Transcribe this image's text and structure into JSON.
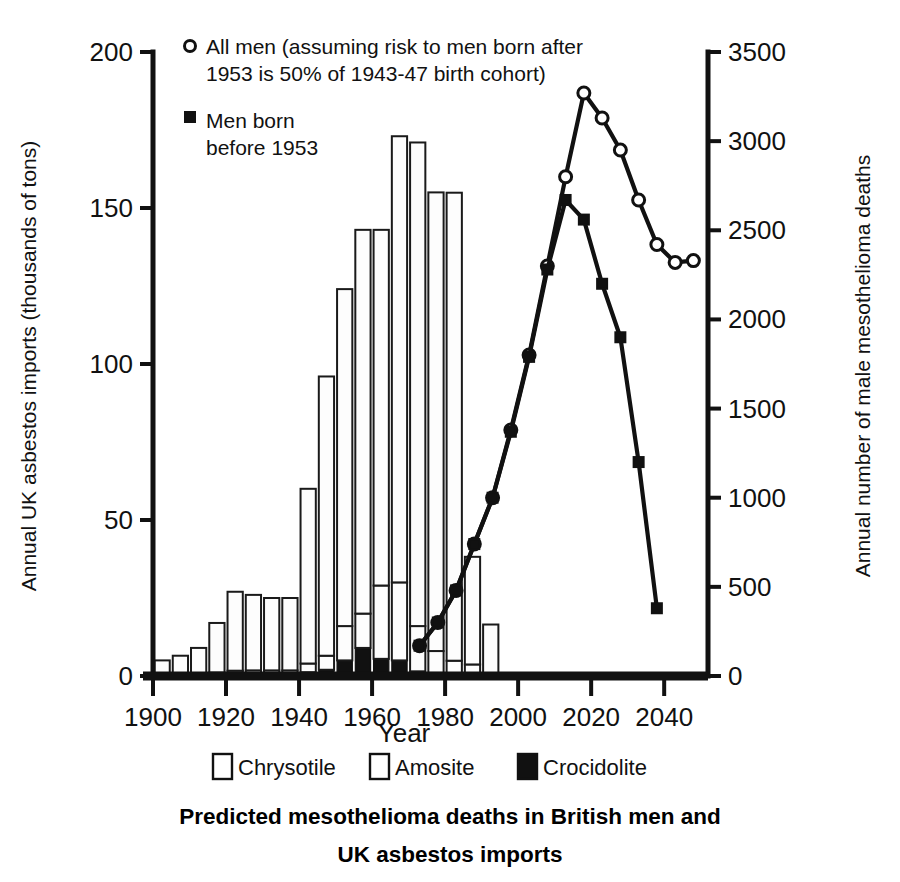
{
  "title": {
    "line1": "Predicted mesothelioma deaths in British men and",
    "line2": "UK asbestos imports"
  },
  "axes": {
    "left_label": "Annual UK asbestos imports (thousands of tons)",
    "right_label": "Annual number of male mesothelioma deaths",
    "x_label": "Year",
    "left_ticks": [
      "0",
      "50",
      "100",
      "150",
      "200"
    ],
    "right_ticks": [
      "0",
      "500",
      "1000",
      "1500",
      "2000",
      "2500",
      "3000",
      "3500"
    ],
    "x_ticks": [
      "1900",
      "1920",
      "1940",
      "1960",
      "1980",
      "2000",
      "2020",
      "2040"
    ]
  },
  "legend": {
    "series1_line1": "All men (assuming risk to men born after",
    "series1_line2": "1953 is 50% of 1943-47 birth cohort)",
    "series2_line1": "Men born",
    "series2_line2": "before 1953",
    "marker1": "open-circle-marker",
    "marker2": "filled-square-marker"
  },
  "key": {
    "items": [
      {
        "label": "Chrysotile",
        "swatch": "white-square-swatch",
        "color": "#ffffff"
      },
      {
        "label": "Amosite",
        "swatch": "white-square-swatch",
        "color": "#ffffff"
      },
      {
        "label": "Crocidolite",
        "swatch": "black-square-swatch",
        "color": "#111111"
      }
    ]
  },
  "colors": {
    "ink": "#111111",
    "fill_light": "#fdfdfd",
    "fill_dark": "#111111"
  },
  "chart_data": {
    "type": "bar",
    "xlabel": "Year",
    "ylabel": "Annual UK asbestos imports (thousands of tons)",
    "y2label": "Annual number of male mesothelioma deaths",
    "xlim": [
      1900,
      2052
    ],
    "ylim": [
      0,
      200
    ],
    "y2lim": [
      0,
      3500
    ],
    "grid": false,
    "legend_position": "top-left and bottom",
    "bars": {
      "note": "Stacked bars, 5-year bins plotted at bin start year; values in thousands of tons",
      "bin_width_years": 5,
      "categories": [
        1900,
        1905,
        1910,
        1915,
        1920,
        1925,
        1930,
        1935,
        1940,
        1945,
        1950,
        1955,
        1960,
        1965,
        1970,
        1975,
        1980,
        1985,
        1990
      ],
      "series": [
        {
          "name": "Crocidolite",
          "values": [
            0.3,
            0.4,
            0.5,
            0.6,
            0.8,
            0.8,
            0.8,
            0.8,
            1.2,
            2.0,
            5.0,
            9.0,
            5.5,
            5.0,
            1.5,
            1.0,
            0.4,
            0.2,
            0.0
          ]
        },
        {
          "name": "Amosite",
          "values": [
            0.2,
            0.3,
            0.4,
            0.5,
            0.9,
            1.0,
            1.0,
            1.0,
            2.8,
            4.5,
            11.0,
            11.0,
            23.5,
            25.0,
            14.5,
            7.0,
            4.5,
            3.5,
            0.5
          ]
        },
        {
          "name": "Chrysotile",
          "values": [
            4.5,
            5.8,
            8.1,
            15.9,
            25.3,
            24.2,
            23.2,
            23.2,
            56.0,
            89.5,
            108.0,
            123.0,
            114.0,
            143.0,
            155.0,
            147.0,
            150.0,
            34.5,
            16.0
          ]
        }
      ],
      "totals": [
        5.0,
        6.5,
        9.0,
        17.0,
        27.0,
        26.0,
        25.0,
        25.0,
        60.0,
        96.0,
        124.0,
        143.0,
        143.0,
        173.0,
        171.0,
        155.0,
        164.9,
        38.2,
        16.5
      ]
    },
    "lines": [
      {
        "name": "All men (assuming risk to men born after 1953 is 50% of 1943-47 birth cohort)",
        "marker": "open-circle",
        "axis": "right",
        "x": [
          1973,
          1978,
          1983,
          1988,
          1993,
          1998,
          2003,
          2008,
          2013,
          2018,
          2023,
          2028,
          2033,
          2038,
          2043,
          2048
        ],
        "y": [
          170,
          300,
          480,
          740,
          1000,
          1380,
          1800,
          2300,
          2800,
          3270,
          3130,
          2950,
          2670,
          2420,
          2320,
          2330
        ]
      },
      {
        "name": "Men born before 1953",
        "marker": "filled-square",
        "axis": "right",
        "x": [
          1973,
          1978,
          1983,
          1988,
          1993,
          1998,
          2003,
          2008,
          2013,
          2018,
          2023,
          2028,
          2033,
          2038
        ],
        "y": [
          170,
          300,
          480,
          740,
          1000,
          1370,
          1790,
          2280,
          2670,
          2560,
          2200,
          1900,
          1200,
          380
        ]
      }
    ]
  }
}
